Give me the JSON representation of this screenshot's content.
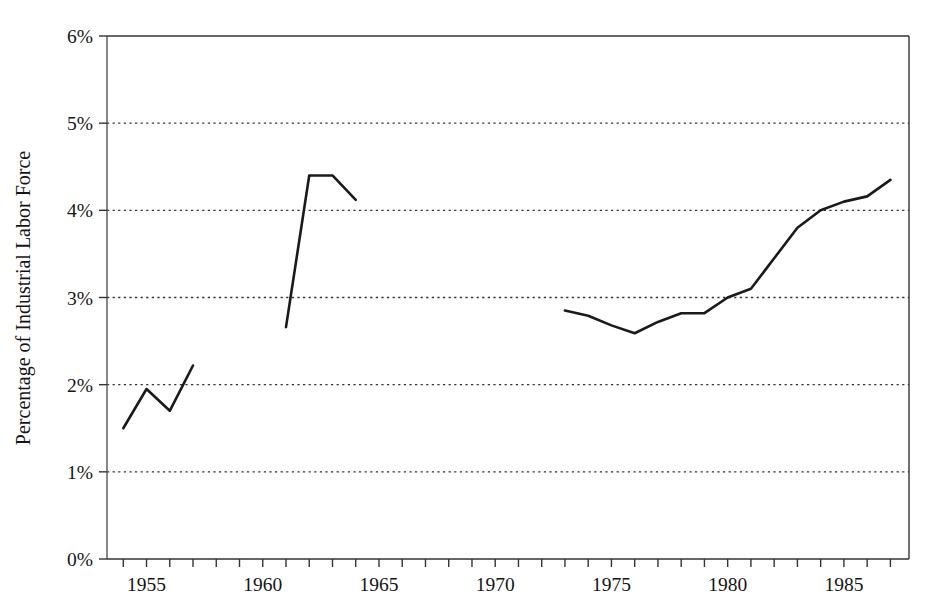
{
  "chart_data": {
    "type": "line",
    "title": "",
    "subtitle": "",
    "xlabel": "",
    "ylabel": "Percentage of Industrial Labor Force",
    "xlim": [
      1953.3,
      1987.8
    ],
    "ylim": [
      0,
      6
    ],
    "grid": true,
    "grid_axis": "y",
    "grid_style": "dotted",
    "legend": "none",
    "line_color": "#1a1a1a",
    "line_width": 2.6,
    "background_color": "#ffffff",
    "axis_color": "#333333",
    "y_ticks": [
      0,
      1,
      2,
      3,
      4,
      5,
      6
    ],
    "y_tick_labels": [
      "0%",
      "1%",
      "2%",
      "3%",
      "4%",
      "5%",
      "6%"
    ],
    "y_tick_suffix": "%",
    "x_ticks": [
      1954,
      1955,
      1956,
      1957,
      1958,
      1959,
      1960,
      1961,
      1962,
      1963,
      1964,
      1965,
      1966,
      1967,
      1968,
      1969,
      1970,
      1971,
      1972,
      1973,
      1974,
      1975,
      1976,
      1977,
      1978,
      1979,
      1980,
      1981,
      1982,
      1983,
      1984,
      1985,
      1986,
      1987
    ],
    "x_tick_labels_shown": [
      "1955",
      "1960",
      "1965",
      "1970",
      "1975",
      "1980",
      "1985"
    ],
    "x_labeled_ticks": [
      1955,
      1960,
      1965,
      1970,
      1975,
      1980,
      1985
    ],
    "series": [
      {
        "name": "segment-1",
        "x": [
          1954,
          1955,
          1956,
          1957
        ],
        "values": [
          1.5,
          1.95,
          1.7,
          2.22
        ]
      },
      {
        "name": "segment-2",
        "x": [
          1961,
          1962,
          1963,
          1964
        ],
        "values": [
          2.66,
          4.4,
          4.4,
          4.12
        ]
      },
      {
        "name": "segment-3",
        "x": [
          1973,
          1974,
          1975,
          1976,
          1977,
          1978,
          1979,
          1980,
          1981,
          1982,
          1983,
          1984,
          1985,
          1986,
          1987
        ],
        "values": [
          2.85,
          2.79,
          2.68,
          2.59,
          2.72,
          2.82,
          2.82,
          3.0,
          3.1,
          3.45,
          3.8,
          4.0,
          4.1,
          4.16,
          4.35
        ]
      }
    ]
  },
  "axes": {
    "y_axis_title": "Percentage of Industrial Labor Force"
  }
}
